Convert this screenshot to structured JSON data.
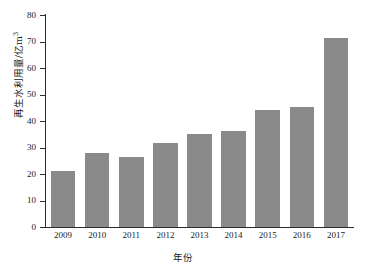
{
  "chart_data": {
    "type": "bar",
    "title": "",
    "xlabel": "年份",
    "ylabel": "再生水利用量/亿m³",
    "ylabel_base": "再生水利用量/亿m",
    "ylabel_sup": "3",
    "categories": [
      "2009",
      "2010",
      "2011",
      "2012",
      "2013",
      "2014",
      "2015",
      "2016",
      "2017"
    ],
    "values": [
      21.3,
      27.8,
      26.5,
      31.6,
      35.2,
      36.1,
      44.2,
      45.3,
      71.5
    ],
    "ylim": [
      0,
      80
    ],
    "yticks": [
      0,
      10,
      20,
      30,
      40,
      50,
      60,
      70,
      80
    ],
    "ytick_labels": [
      "0",
      "10",
      "20",
      "30",
      "40",
      "50",
      "60",
      "70",
      "80"
    ],
    "grid": false,
    "legend": false,
    "legend_position": "none",
    "series": [
      {
        "name": "再生水利用量",
        "values": [
          21.3,
          27.8,
          26.5,
          31.6,
          35.2,
          36.1,
          44.2,
          45.3,
          71.5
        ]
      }
    ],
    "colors": {
      "bar": "#8a8a8a",
      "axis": "#2b2b2b",
      "text": "#1a1a1a",
      "background": "#ffffff"
    }
  }
}
